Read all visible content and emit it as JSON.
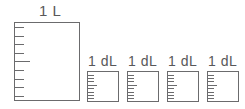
{
  "diagram": {
    "stroke_color": "#6b6b6d",
    "text_color": "#58585a",
    "background_color": "#ffffff"
  },
  "liter_container": {
    "label": "1 L",
    "unit": "L",
    "value": "1",
    "tick_count": 9,
    "major_tick_index": 4
  },
  "deciliter_containers": [
    {
      "label": "1 dL",
      "unit": "dL",
      "value": "1",
      "tick_count": 8,
      "major_tick_index": 3
    },
    {
      "label": "1 dL",
      "unit": "dL",
      "value": "1",
      "tick_count": 8,
      "major_tick_index": 3
    },
    {
      "label": "1 dL",
      "unit": "dL",
      "value": "1",
      "tick_count": 8,
      "major_tick_index": 3
    },
    {
      "label": "1 dL",
      "unit": "dL",
      "value": "1",
      "tick_count": 8,
      "major_tick_index": 3
    }
  ]
}
